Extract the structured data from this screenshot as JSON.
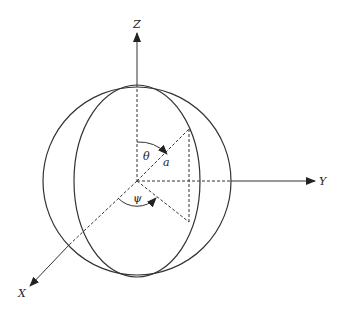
{
  "diagram": {
    "type": "spherical-coordinate-system",
    "axes": {
      "z": "Z",
      "y": "Y",
      "x": "X"
    },
    "angles": {
      "theta": "θ",
      "psi": "ψ"
    },
    "radius_label": "a",
    "colors": {
      "line": "#333333",
      "background": "#ffffff"
    }
  }
}
